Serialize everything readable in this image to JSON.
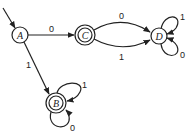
{
  "diagram": {
    "type": "finite-state-automaton",
    "start_state": "A",
    "states": [
      {
        "id": "A",
        "label": "A",
        "accepting": false
      },
      {
        "id": "B",
        "label": "B",
        "accepting": true
      },
      {
        "id": "C",
        "label": "C",
        "accepting": true
      },
      {
        "id": "D",
        "label": "D",
        "accepting": false
      }
    ],
    "transitions": [
      {
        "from": "A",
        "to": "C",
        "label": "0"
      },
      {
        "from": "A",
        "to": "B",
        "label": "1"
      },
      {
        "from": "C",
        "to": "D",
        "label": "0"
      },
      {
        "from": "C",
        "to": "D",
        "label": "1"
      },
      {
        "from": "D",
        "to": "D",
        "label": "1"
      },
      {
        "from": "D",
        "to": "D",
        "label": "0"
      },
      {
        "from": "B",
        "to": "B",
        "label": "1"
      },
      {
        "from": "B",
        "to": "B",
        "label": "0"
      }
    ]
  }
}
